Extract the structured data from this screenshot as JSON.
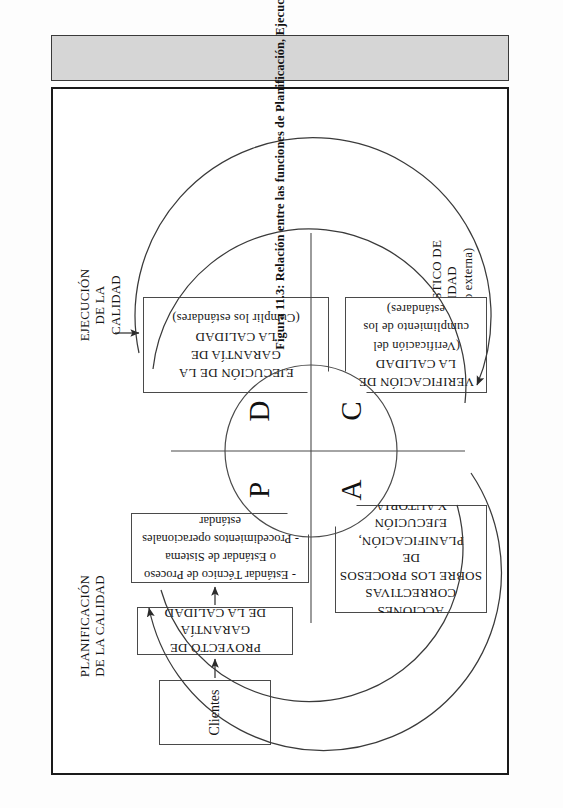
{
  "figure": {
    "caption": "Figura 11.3: Relación entre las funciones de Planificación, Ejecución y Autoría, en la Garantía de la Calidad.",
    "colors": {
      "frame_border": "#1a1a1a",
      "caption_bar_bg": "#d6d6d6",
      "box_border": "#4a4a4a",
      "line": "#3a3a3a",
      "text": "#151515"
    }
  },
  "labels": {
    "planificacion": "PLANIFICACIÓN\nDE LA CALIDAD",
    "planificacion_l1": "PLANIFICACIÓN",
    "planificacion_l2": "DE LA CALIDAD",
    "ejecucion_l1": "EJECUCIÓN",
    "ejecucion_l2": "DE LA",
    "ejecucion_l3": "CALIDAD",
    "diagnostico_l1": "DIAGNÓSTICO DE",
    "diagnostico_l2": "CALIDAD",
    "diagnostico_l3": "(Interna o externa)"
  },
  "boxes": {
    "clientes": {
      "label": "Clientes"
    },
    "proyecto": {
      "line1": "PROYECTO DE GARANTÍA",
      "line2": "DE LA CALIDAD"
    },
    "estandares": {
      "line1": "- Estándar Técnico de Proceso",
      "line2": "o Estándar de Sistema",
      "line3": "- Procedimientos operacionales",
      "line4": "estándar"
    },
    "ejecucion_garantia": {
      "line1": "EJECUCIÓN DE LA",
      "line2": "GARANTÍA DE",
      "line3": "LA CALIDAD",
      "note": "(Cumplir los estándares)"
    },
    "verificacion": {
      "line1": "VERIFICACIÓN DE",
      "line2": "LA CALIDAD",
      "note1": "(Verificación del",
      "note2": "cumplimiento de los estándares)"
    },
    "acciones": {
      "line1": "ACCIONES CORRECTIVAS",
      "line2": "SOBRE LOS PROCESOS DE",
      "line3": "PLANIFICACIÓN,",
      "line4": "EJECUCIÓN",
      "line5": "Y AUTORIA"
    }
  },
  "pdca": {
    "top_left": "P",
    "top_right": "D",
    "bottom_left": "A",
    "bottom_right": "C"
  }
}
